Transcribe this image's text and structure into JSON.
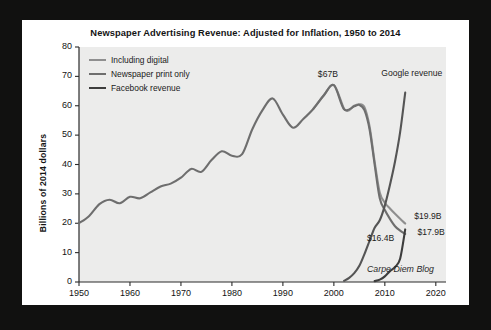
{
  "chart_data": {
    "type": "line",
    "title": "Newspaper Advertising Revenue: Adjusted for Inflation, 1950 to 2014",
    "xlabel": "",
    "ylabel": "Billions of 2014 dollars",
    "xlim": [
      1950,
      2022
    ],
    "ylim": [
      0,
      80
    ],
    "xticks": [
      1950,
      1960,
      1970,
      1980,
      1990,
      2000,
      2010,
      2020
    ],
    "yticks": [
      0,
      10,
      20,
      30,
      40,
      50,
      60,
      70,
      80
    ],
    "grid": false,
    "legend_position": "top-left",
    "series": [
      {
        "name": "Including digital",
        "color": "#8f8f8f",
        "x": [
          1996,
          1998,
          2000,
          2002,
          2003,
          2004,
          2005,
          2006,
          2007,
          2008,
          2009,
          2010,
          2011,
          2012,
          2013,
          2014
        ],
        "values": [
          59.0,
          63.5,
          67.0,
          59.0,
          58.5,
          60.0,
          60.5,
          59.5,
          53.0,
          41.0,
          30.5,
          27.0,
          25.0,
          23.2,
          21.5,
          19.9
        ]
      },
      {
        "name": "Newspaper print only",
        "color": "#6e6e6e",
        "x": [
          1950,
          1952,
          1954,
          1956,
          1958,
          1960,
          1962,
          1964,
          1966,
          1968,
          1970,
          1972,
          1974,
          1976,
          1978,
          1980,
          1982,
          1984,
          1986,
          1988,
          1990,
          1992,
          1994,
          1996,
          1998,
          2000,
          2002,
          2004,
          2005,
          2006,
          2007,
          2008,
          2009,
          2010,
          2011,
          2012,
          2013,
          2014
        ],
        "values": [
          20.0,
          22.5,
          26.5,
          28.0,
          26.8,
          29.0,
          28.5,
          30.5,
          32.5,
          33.5,
          35.5,
          38.5,
          37.5,
          41.5,
          44.5,
          43.0,
          43.5,
          52.0,
          58.5,
          62.5,
          57.0,
          52.5,
          55.5,
          59.0,
          63.5,
          67.0,
          58.8,
          59.8,
          60.3,
          58.5,
          52.0,
          40.0,
          28.5,
          24.5,
          21.5,
          19.0,
          17.5,
          16.4
        ]
      },
      {
        "name": "Google revenue",
        "color": "#555555",
        "x": [
          2002,
          2003,
          2004,
          2005,
          2006,
          2007,
          2008,
          2009,
          2010,
          2011,
          2012,
          2013,
          2014
        ],
        "values": [
          0.4,
          1.4,
          3.0,
          5.5,
          9.5,
          14.0,
          18.5,
          21.0,
          26.0,
          33.0,
          41.0,
          51.0,
          64.5
        ]
      },
      {
        "name": "Facebook revenue",
        "color": "#3d3d3d",
        "x": [
          2008,
          2009,
          2010,
          2011,
          2012,
          2013,
          2014
        ],
        "values": [
          0.3,
          0.8,
          1.9,
          3.7,
          5.1,
          7.9,
          17.9
        ]
      }
    ],
    "annotations": [
      {
        "name": "peak-label",
        "text": "$67B",
        "x": 2000,
        "y": 67
      },
      {
        "name": "google-label",
        "text": "Google revenue",
        "x": 2014,
        "y": 70
      },
      {
        "name": "including-digital-end-label",
        "text": "$19.9B",
        "x": 2015,
        "y": 22
      },
      {
        "name": "print-only-end-label",
        "text": "$16.4B",
        "x": 2012,
        "y": 15
      },
      {
        "name": "facebook-end-label",
        "text": "$17.9B",
        "x": 2016,
        "y": 17
      },
      {
        "name": "watermark",
        "text": "Carpe Diem Blog",
        "x": 2012,
        "y": 4
      }
    ]
  },
  "legend": {
    "items": [
      {
        "label": "Including digital",
        "color": "#8f8f8f"
      },
      {
        "label": "Newspaper print only",
        "color": "#6e6e6e"
      },
      {
        "label": "Facebook revenue",
        "color": "#3d3d3d"
      }
    ]
  },
  "colors": {
    "plot_background": "#ececeb",
    "card_background": "#ffffff",
    "frame": "#111110",
    "axis": "#2b2b2b",
    "text": "#141414"
  }
}
